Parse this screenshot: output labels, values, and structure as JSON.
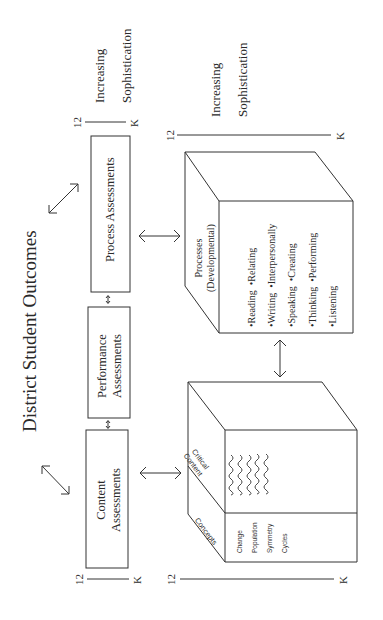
{
  "title": "District Student Outcomes",
  "assessments": {
    "process": "Process Assessments",
    "performance_line1": "Performance",
    "performance_line2": "Assessments",
    "content_line1": "Content",
    "content_line2": "Assessments"
  },
  "scales": {
    "top": {
      "start": "12",
      "end": "K",
      "label_line1": "Increasing",
      "label_line2": "Sophistication"
    },
    "cube": {
      "start": "12",
      "end": "K",
      "label_line1": "Increasing",
      "label_line2": "Sophistication"
    },
    "left_small": {
      "start": "12",
      "end": "K"
    },
    "bottom": {
      "start": "12",
      "end": "K"
    }
  },
  "process_cube": {
    "title_line1": "Processes",
    "title_line2": "(Developmental)",
    "items": [
      [
        "•Reading",
        "•Relating"
      ],
      [
        "•Writing",
        "•Interpersonally"
      ],
      [
        "•Speaking",
        "•Creating"
      ],
      [
        "•Thinking",
        "•Performing"
      ],
      [
        "•Listening",
        ""
      ]
    ]
  },
  "content_cube": {
    "side_top_line1": "Critical",
    "side_top_line2": "Content",
    "side_bottom": "Concepts",
    "concepts": [
      "Change",
      "Population",
      "Symmetry",
      "Cycles"
    ]
  },
  "colors": {
    "line": "#333333",
    "background": "#ffffff"
  }
}
